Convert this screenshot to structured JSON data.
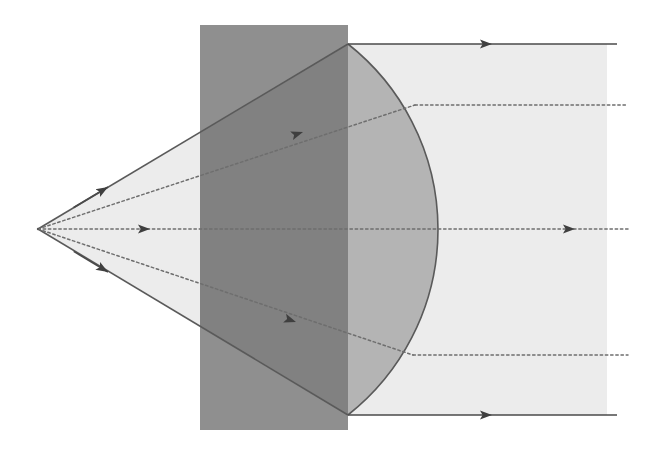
{
  "figure": {
    "width": 659,
    "height": 453,
    "background": "#ffffff"
  },
  "colors": {
    "background": "#ffffff",
    "block_fill": "#8f8f8f",
    "lens_fill": "#b4b4b4",
    "beam_fill": "#ececec",
    "cone_fill": "#ececec",
    "outline": "#5a5a5a",
    "ray_solid": "#4a4a4a",
    "ray_dotted": "#6e6e6e",
    "arrow_fill": "#3f3f3f"
  },
  "geometry": {
    "source_point": {
      "x": 38,
      "y": 229,
      "label": "point-source"
    },
    "optical_axis_y": 229,
    "block": {
      "label": "dark-rectangular-block",
      "x": 200,
      "y": 25,
      "width": 148,
      "height": 405,
      "right_edge_x": 348
    },
    "lens": {
      "label": "plano-convex-lens",
      "flat_edge_x": 348,
      "top_vertex": {
        "x": 348,
        "y": 44
      },
      "bottom_vertex": {
        "x": 348,
        "y": 415
      },
      "apex_x": 438,
      "curvature": "convex-right"
    },
    "cone": {
      "label": "diverging-light-cone",
      "apex": {
        "x": 38,
        "y": 229
      },
      "top_edge_end": {
        "x": 348,
        "y": 44
      },
      "bottom_edge_end": {
        "x": 348,
        "y": 415
      }
    },
    "beam": {
      "label": "collimated-output-beam",
      "x_start": 348,
      "x_end": 607,
      "y_top": 44,
      "y_bottom": 415
    }
  },
  "rays": [
    {
      "id": "ray-outer-top",
      "style": "solid",
      "incident_from": {
        "x": 38,
        "y": 229
      },
      "incident_to": {
        "x": 348,
        "y": 44
      },
      "incident_arrow_at": {
        "x": 108,
        "y": 187
      },
      "outgoing_from": {
        "x": 348,
        "y": 44
      },
      "outgoing_to": {
        "x": 617,
        "y": 44
      },
      "outgoing_arrow_at": {
        "x": 492,
        "y": 44
      }
    },
    {
      "id": "ray-inner-top",
      "style": "dotted",
      "incident_from": {
        "x": 38,
        "y": 229
      },
      "incident_to": {
        "x": 415,
        "y": 105
      },
      "incident_arrow_at": {
        "x": 303,
        "y": 132
      },
      "outgoing_from": {
        "x": 415,
        "y": 105
      },
      "outgoing_to": {
        "x": 628,
        "y": 105
      },
      "outgoing_arrow_at": null
    },
    {
      "id": "ray-axis",
      "style": "dotted",
      "incident_from": {
        "x": 38,
        "y": 229
      },
      "incident_to": {
        "x": 438,
        "y": 229
      },
      "incident_arrow_at": {
        "x": 150,
        "y": 229
      },
      "outgoing_from": {
        "x": 438,
        "y": 229
      },
      "outgoing_to": {
        "x": 628,
        "y": 229
      },
      "outgoing_arrow_at": {
        "x": 575,
        "y": 229
      }
    },
    {
      "id": "ray-inner-bottom",
      "style": "dotted",
      "incident_from": {
        "x": 38,
        "y": 229
      },
      "incident_to": {
        "x": 413,
        "y": 355
      },
      "incident_arrow_at": {
        "x": 296,
        "y": 322
      },
      "outgoing_from": {
        "x": 413,
        "y": 355
      },
      "outgoing_to": {
        "x": 628,
        "y": 355
      },
      "outgoing_arrow_at": null
    },
    {
      "id": "ray-outer-bottom",
      "style": "solid",
      "incident_from": {
        "x": 38,
        "y": 229
      },
      "incident_to": {
        "x": 348,
        "y": 415
      },
      "incident_arrow_at": {
        "x": 108,
        "y": 272
      },
      "outgoing_from": {
        "x": 348,
        "y": 415
      },
      "outgoing_to": {
        "x": 617,
        "y": 415
      },
      "outgoing_arrow_at": {
        "x": 492,
        "y": 415
      }
    }
  ],
  "labels": {
    "none_visible": ""
  }
}
